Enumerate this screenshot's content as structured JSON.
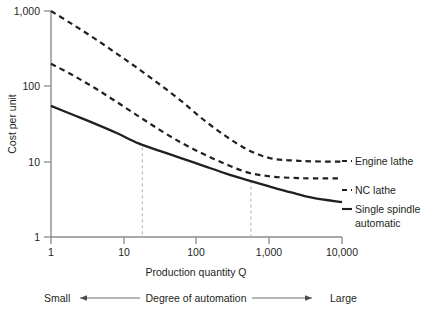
{
  "chart_data": {
    "type": "line",
    "title": "",
    "xlabel": "Production quantity Q",
    "ylabel": "Cost per unit",
    "xscale": "log",
    "yscale": "log",
    "xlim": [
      1,
      10000
    ],
    "ylim": [
      1,
      1000
    ],
    "grid": false,
    "legend_position": "right",
    "xticks": [
      1,
      10,
      100,
      1000,
      10000
    ],
    "xtick_labels": [
      "1",
      "10",
      "100",
      "1,000",
      "10,000"
    ],
    "yticks": [
      1,
      10,
      100,
      1000
    ],
    "ytick_labels": [
      "1",
      "10",
      "100",
      "1,000"
    ],
    "series": [
      {
        "name": "Engine lathe",
        "style": "dashed",
        "color": "#231f20",
        "x": [
          1,
          2,
          4,
          8,
          16,
          32,
          64,
          125,
          250,
          500,
          1000,
          2000,
          4000,
          10000
        ],
        "y": [
          1000,
          660,
          430,
          272,
          170,
          104,
          62,
          36,
          22,
          14.5,
          11.2,
          10.4,
          10.1,
          10.0
        ]
      },
      {
        "name": "NC lathe",
        "style": "dashed",
        "color": "#231f20",
        "x": [
          1,
          2,
          4,
          8,
          16,
          32,
          64,
          125,
          250,
          500,
          1000,
          2000,
          4000,
          10000
        ],
        "y": [
          200,
          140,
          95,
          62,
          40,
          26,
          17.5,
          12.6,
          9.3,
          7.2,
          6.4,
          6.1,
          6.0,
          6.0
        ]
      },
      {
        "name": "Single spindle automatic",
        "style": "solid",
        "color": "#231f20",
        "x": [
          1,
          2,
          4,
          8,
          16,
          32,
          64,
          125,
          250,
          500,
          1000,
          2000,
          4000,
          10000
        ],
        "y": [
          55,
          42,
          32,
          24,
          17.5,
          13.8,
          11.0,
          8.8,
          7.0,
          5.7,
          4.7,
          3.9,
          3.3,
          2.9
        ]
      }
    ],
    "annotations": {
      "breakeven_lines": [
        {
          "name": "breakeven-1",
          "x": 18,
          "y_top": 15.5,
          "label": ""
        },
        {
          "name": "breakeven-2",
          "x": 560,
          "y_top": 5.6,
          "label": ""
        }
      ]
    },
    "legend_entries": [
      {
        "label": "Engine lathe",
        "style": "dashed"
      },
      {
        "label": "NC lathe",
        "style": "dashed"
      },
      {
        "label": "Single spindle",
        "label2": "automatic",
        "style": "solid"
      }
    ]
  },
  "automation_scale": {
    "left_label": "Small",
    "center_label": "Degree of automation",
    "right_label": "Large"
  },
  "colors": {
    "ink": "#231f20",
    "axis": "#8c8c8c",
    "guide": "#b0b0b0",
    "background": "#ffffff"
  }
}
